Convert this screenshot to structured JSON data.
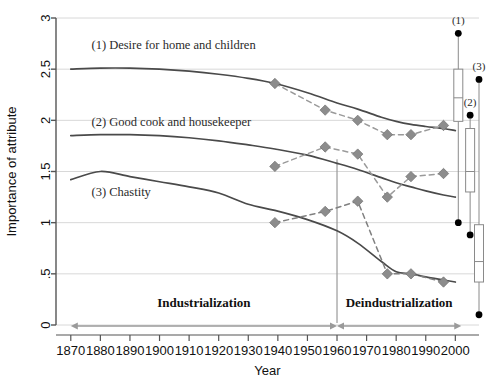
{
  "chart_data": {
    "type": "line",
    "title": "",
    "xlabel": "Year",
    "ylabel": "Importance of attribute",
    "xlim": [
      1865,
      2008
    ],
    "ylim": [
      0,
      3
    ],
    "grid": true,
    "legend_position": "inline-annotations",
    "xticks": [
      1870,
      1880,
      1890,
      1900,
      1910,
      1920,
      1930,
      1940,
      1950,
      1960,
      1970,
      1980,
      1990,
      2000
    ],
    "xtick_labels": [
      "1870",
      "1880",
      "1890",
      "1900",
      "1910",
      "1920",
      "1930",
      "1940",
      "1950",
      "1960",
      "1970",
      "1980",
      "1990",
      "2000"
    ],
    "yticks": [
      0,
      0.5,
      1,
      1.5,
      2,
      2.5,
      3
    ],
    "ytick_labels": [
      "0",
      ".5",
      "1",
      "1.5",
      "2",
      "2.5",
      "3"
    ],
    "series": [
      {
        "name": "(1) Desire for home and children",
        "style": "solid",
        "color": "#4a4a4a",
        "x": [
          1870,
          1880,
          1890,
          1900,
          1910,
          1920,
          1930,
          1939,
          1950,
          1960,
          1967,
          1975,
          1980,
          1985,
          1990,
          1996,
          2000
        ],
        "values": [
          2.5,
          2.51,
          2.51,
          2.5,
          2.48,
          2.45,
          2.41,
          2.36,
          2.27,
          2.17,
          2.11,
          2.03,
          1.99,
          1.96,
          1.94,
          1.92,
          1.9
        ]
      },
      {
        "name": "(2) Good cook and housekeeper",
        "style": "solid",
        "color": "#4a4a4a",
        "x": [
          1870,
          1880,
          1890,
          1900,
          1910,
          1920,
          1930,
          1939,
          1950,
          1960,
          1967,
          1975,
          1980,
          1985,
          1990,
          1996,
          2000
        ],
        "values": [
          1.85,
          1.86,
          1.86,
          1.85,
          1.83,
          1.8,
          1.76,
          1.72,
          1.66,
          1.58,
          1.52,
          1.44,
          1.39,
          1.35,
          1.31,
          1.27,
          1.25
        ]
      },
      {
        "name": "(3) Chastity",
        "style": "solid",
        "color": "#4a4a4a",
        "x": [
          1870,
          1880,
          1890,
          1900,
          1910,
          1920,
          1930,
          1939,
          1950,
          1960,
          1967,
          1975,
          1980,
          1985,
          1990,
          1996,
          2000
        ],
        "values": [
          1.42,
          1.5,
          1.45,
          1.4,
          1.35,
          1.29,
          1.18,
          1.12,
          1.03,
          0.92,
          0.8,
          0.62,
          0.52,
          0.5,
          0.47,
          0.44,
          0.42
        ]
      },
      {
        "name": "(1) Desire for home and children — observed",
        "style": "dashed-markers",
        "color": "#9a9a9a",
        "x": [
          1939,
          1956,
          1967,
          1977,
          1985,
          1996
        ],
        "values": [
          2.36,
          2.1,
          2.0,
          1.86,
          1.86,
          1.95
        ]
      },
      {
        "name": "(2) Good cook and housekeeper — observed",
        "style": "dashed-markers",
        "color": "#9a9a9a",
        "x": [
          1939,
          1956,
          1967,
          1977,
          1985,
          1996
        ],
        "values": [
          1.55,
          1.74,
          1.67,
          1.25,
          1.45,
          1.48
        ]
      },
      {
        "name": "(3) Chastity — observed",
        "style": "dashed-markers",
        "color": "#808080",
        "x": [
          1939,
          1956,
          1967,
          1977,
          1985,
          1996
        ],
        "values": [
          1.0,
          1.11,
          1.21,
          0.5,
          0.5,
          0.42
        ]
      }
    ],
    "annotations": [
      {
        "label": "(1) Desire for home and children",
        "x": 1877,
        "y": 2.7
      },
      {
        "label": "(2) Good cook and housekeeper",
        "x": 1877,
        "y": 1.94
      },
      {
        "label": "(3) Chastity",
        "x": 1877,
        "y": 1.26
      }
    ],
    "eras": [
      {
        "label": "Industrialization",
        "start": 1870,
        "end": 1960,
        "label_x": 1915,
        "label_y": 0.18
      },
      {
        "label": "Deindustrialization",
        "start": 1960,
        "end": 2002,
        "label_x": 1981,
        "label_y": 0.18
      }
    ],
    "era_divider_year": 1960,
    "boxplots": [
      {
        "label": "(1)",
        "x": 2001,
        "lower_whisker": 1.0,
        "q1": 1.99,
        "median": 2.22,
        "q3": 2.5,
        "upper_whisker": 2.85
      },
      {
        "label": "(2)",
        "x": 2005,
        "lower_whisker": 0.88,
        "q1": 1.3,
        "median": 1.5,
        "q3": 1.92,
        "upper_whisker": 2.05
      },
      {
        "label": "(3)",
        "x": 2008,
        "lower_whisker": 0.1,
        "q1": 0.42,
        "median": 0.62,
        "q3": 0.98,
        "upper_whisker": 2.4
      }
    ]
  },
  "colors": {
    "solid_line": "#4a4a4a",
    "dashed_line": "#9a9a9a",
    "marker": "#8c8c8c",
    "grid": "#d8d8d8",
    "axis": "#555555",
    "era_arrow": "#9a9a9a",
    "boxplot_point": "#000000",
    "boxplot_outline": "#8a8a8a"
  }
}
